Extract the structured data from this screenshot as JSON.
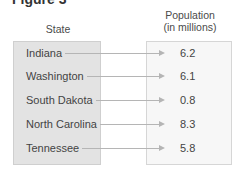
{
  "figure": {
    "title": "Figure 3",
    "domain_header": "State",
    "range_header_line1": "Population",
    "range_header_line2": "(in millions)",
    "mappings": [
      {
        "state": "Indiana",
        "population": "6.2"
      },
      {
        "state": "Washington",
        "population": "6.1"
      },
      {
        "state": "South Dakota",
        "population": "0.8"
      },
      {
        "state": "North Carolina",
        "population": "8.3"
      },
      {
        "state": "Tennessee",
        "population": "5.8"
      }
    ]
  }
}
